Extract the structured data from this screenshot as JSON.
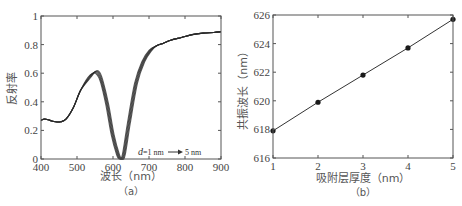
{
  "chart_data": [
    {
      "panel": "a",
      "type": "line",
      "title": "",
      "caption": "（a）",
      "xlabel": "波长（nm）",
      "ylabel": "反射率",
      "xlim": [
        400,
        900
      ],
      "ylim": [
        0,
        1
      ],
      "xticks": [
        400,
        500,
        600,
        700,
        800,
        900
      ],
      "yticks": [
        0,
        0.2,
        0.4,
        0.6,
        0.8,
        1
      ],
      "ytick_labels": [
        "0",
        "0.2",
        "0.4",
        "0.6",
        "0.8",
        "1"
      ],
      "grid": false,
      "annotation": {
        "var": "d",
        "text": "=1 nm",
        "arrow": "→",
        "end": "5 nm"
      },
      "series_note": "5 overlapping curves for d = 1 nm to 5 nm; resonance dip shifts from ~618 to ~626 nm",
      "series": [
        {
          "name": "d=1 nm to 5 nm (overlapping)",
          "x": [
            400,
            410,
            425,
            440,
            455,
            470,
            490,
            510,
            530,
            545,
            555,
            565,
            580,
            595,
            610,
            618,
            626,
            640,
            660,
            680,
            700,
            720,
            740,
            760,
            790,
            820,
            850,
            880,
            900
          ],
          "y": [
            0.27,
            0.28,
            0.27,
            0.26,
            0.26,
            0.28,
            0.36,
            0.48,
            0.57,
            0.6,
            0.59,
            0.54,
            0.38,
            0.17,
            0.03,
            0.0,
            0.03,
            0.25,
            0.53,
            0.68,
            0.76,
            0.79,
            0.81,
            0.83,
            0.85,
            0.87,
            0.88,
            0.885,
            0.89
          ]
        }
      ]
    },
    {
      "panel": "b",
      "type": "line",
      "title": "",
      "caption": "（b）",
      "xlabel": "吸附层厚度（nm）",
      "ylabel": "共振波长（nm）",
      "xlim": [
        1,
        5
      ],
      "ylim": [
        616,
        626
      ],
      "xticks": [
        1,
        2,
        3,
        4,
        5
      ],
      "yticks": [
        616,
        618,
        620,
        622,
        624,
        626
      ],
      "grid": false,
      "markers": true,
      "series": [
        {
          "name": "resonance wavelength",
          "x": [
            1,
            2,
            3,
            4,
            5
          ],
          "y": [
            617.9,
            619.9,
            621.8,
            623.7,
            625.7
          ]
        }
      ]
    }
  ],
  "panel_a": {
    "xlabel": "波长（nm）",
    "ylabel": "反射率",
    "caption": "（a）",
    "xtick_labels": [
      "400",
      "500",
      "600",
      "700",
      "800",
      "900"
    ],
    "ytick_labels": [
      "0",
      "0.2",
      "0.4",
      "0.6",
      "0.8",
      "1"
    ],
    "annotation_var": "d",
    "annotation_start": "=1 nm",
    "annotation_end": "5 nm"
  },
  "panel_b": {
    "xlabel": "吸附层厚度（nm）",
    "ylabel": "共振波长（nm）",
    "caption": "（b）",
    "xtick_labels": [
      "1",
      "2",
      "3",
      "4",
      "5"
    ],
    "ytick_labels": [
      "616",
      "618",
      "620",
      "622",
      "624",
      "626"
    ]
  },
  "colors": {
    "axis": "#555555",
    "curve": "#2a2a2a",
    "text": "#444444"
  }
}
